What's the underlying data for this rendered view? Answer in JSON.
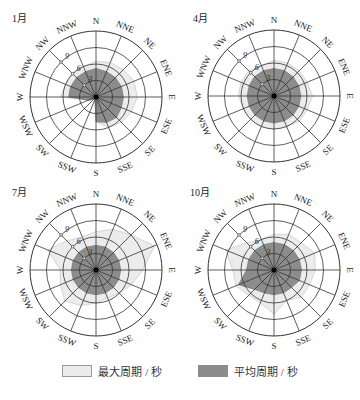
{
  "chart_data": {
    "type": "radar",
    "subtype": "polar-rose",
    "directions": [
      "N",
      "NNE",
      "NE",
      "ENE",
      "E",
      "ESE",
      "SE",
      "SSE",
      "S",
      "SSW",
      "SW",
      "WSW",
      "W",
      "WNW",
      "NW",
      "NNW"
    ],
    "radial_ticks": [
      3,
      6,
      9
    ],
    "radial_max": 12,
    "radial_tick_axis": "NW",
    "unit": "秒",
    "legend": [
      {
        "key": "max",
        "label": "最大周期 / 秒",
        "color": "#ececec"
      },
      {
        "key": "mean",
        "label": "平均周期 / 秒",
        "color": "#8c8c8c"
      }
    ],
    "panels": [
      {
        "title": "1月",
        "series": [
          {
            "name": "最大周期 / 秒",
            "values": [
              6.5,
              6.8,
              7.0,
              7.5,
              7.5,
              7.0,
              6.5,
              6.0,
              4.5,
              0.5,
              0.5,
              1.5,
              6.5,
              6.0,
              6.0,
              6.0
            ]
          },
          {
            "name": "平均周期 / 秒",
            "values": [
              5.2,
              5.0,
              5.0,
              5.0,
              5.0,
              5.0,
              5.3,
              5.0,
              4.5,
              0.5,
              0.5,
              1.5,
              5.0,
              5.0,
              5.0,
              5.0
            ]
          }
        ]
      },
      {
        "title": "4月",
        "series": [
          {
            "name": "最大周期 / 秒",
            "values": [
              6.5,
              6.5,
              6.5,
              6.5,
              7.0,
              6.5,
              6.5,
              6.0,
              6.0,
              6.0,
              6.0,
              6.0,
              6.5,
              6.5,
              6.5,
              6.0
            ]
          },
          {
            "name": "平均周期 / 秒",
            "values": [
              5.0,
              5.0,
              4.9,
              4.9,
              4.9,
              4.9,
              4.9,
              4.9,
              4.9,
              4.9,
              4.9,
              4.9,
              4.9,
              4.9,
              5.0,
              5.0
            ]
          }
        ]
      },
      {
        "title": "7月",
        "series": [
          {
            "name": "最大周期 / 秒",
            "values": [
              7.0,
              8.0,
              9.0,
              11.5,
              8.5,
              7.0,
              6.0,
              5.5,
              6.0,
              7.0,
              8.0,
              7.0,
              6.5,
              9.5,
              7.5,
              6.5
            ]
          },
          {
            "name": "平均周期 / 秒",
            "values": [
              4.5,
              4.5,
              4.5,
              4.5,
              4.5,
              4.5,
              4.5,
              4.5,
              4.5,
              4.5,
              4.5,
              4.5,
              4.5,
              4.5,
              4.5,
              4.5
            ]
          }
        ]
      },
      {
        "title": "10月",
        "series": [
          {
            "name": "最大周期 / 秒",
            "values": [
              6.5,
              7.0,
              7.0,
              8.0,
              7.5,
              7.0,
              7.0,
              6.0,
              8.0,
              6.5,
              6.5,
              7.5,
              7.5,
              9.5,
              7.0,
              6.0
            ]
          },
          {
            "name": "平均周期 / 秒",
            "values": [
              5.0,
              5.0,
              5.0,
              5.0,
              5.0,
              5.0,
              4.5,
              4.5,
              4.5,
              4.5,
              5.0,
              7.0,
              5.0,
              5.0,
              5.0,
              5.0
            ]
          }
        ]
      }
    ]
  },
  "layout": {
    "panels": [
      {
        "cx": 96,
        "cy": 97,
        "title_x": 12,
        "title_y": 22
      },
      {
        "cx": 274,
        "cy": 96,
        "title_x": 193,
        "title_y": 22
      },
      {
        "cx": 96,
        "cy": 270,
        "title_x": 12,
        "title_y": 196
      },
      {
        "cx": 274,
        "cy": 270,
        "title_x": 190,
        "title_y": 196
      }
    ],
    "radius_px": 66,
    "label_offset_px": 10
  },
  "legend": {
    "max_label": "最大周期 / 秒",
    "mean_label": "平均周期 / 秒"
  }
}
